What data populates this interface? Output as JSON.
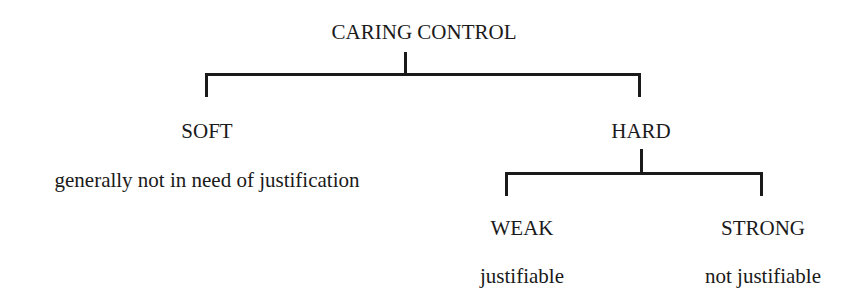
{
  "diagram": {
    "root": {
      "label": "CARING CONTROL"
    },
    "children": [
      {
        "label": "SOFT",
        "description": "generally not in need of justification"
      },
      {
        "label": "HARD",
        "children": [
          {
            "label": "WEAK",
            "description": "justifiable"
          },
          {
            "label": "STRONG",
            "description": "not justifiable"
          }
        ]
      }
    ],
    "line_color": "#1a1a1a"
  }
}
